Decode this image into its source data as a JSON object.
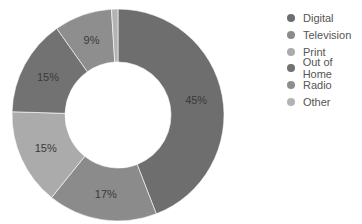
{
  "chart_data": {
    "type": "pie",
    "subtype": "donut",
    "title": "",
    "categories": [
      "Digital",
      "Television",
      "Print",
      "Out of Home",
      "Radio",
      "Other"
    ],
    "values": [
      45,
      17,
      15,
      15,
      9,
      1
    ],
    "labels": [
      "45%",
      "17%",
      "15%",
      "15%",
      "9%",
      ""
    ],
    "colors": [
      "#6e6e6e",
      "#8b8b8b",
      "#ababab",
      "#727272",
      "#8e8e8e",
      "#b3b3b3"
    ],
    "legend_position": "right"
  },
  "legend": {
    "items": [
      {
        "label": "Digital",
        "color": "#6e6e6e"
      },
      {
        "label": "Television",
        "color": "#8b8b8b"
      },
      {
        "label": "Print",
        "color": "#ababab"
      },
      {
        "label": "Out of Home",
        "color": "#727272"
      },
      {
        "label": "Radio",
        "color": "#8e8e8e"
      },
      {
        "label": "Other",
        "color": "#b3b3b3"
      }
    ]
  }
}
